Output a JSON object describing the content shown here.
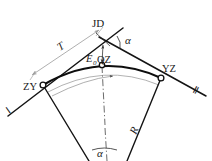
{
  "figure": {
    "colors": {
      "line_main": "#141414",
      "line_dim": "#9a9a9a",
      "line_arc_aux": "#8c8c8c",
      "background": "#ffffff",
      "text": "#1a1a1a"
    },
    "labels": {
      "jd": "JD",
      "alpha_top": "α",
      "alpha_bottom": "α",
      "tangent_len": "T",
      "external": "E",
      "external_sub": "0",
      "curve_mid": "QZ",
      "curve_start": "ZY",
      "curve_end": "YZ",
      "radius": "R",
      "tangent_line_1": "Ⅰ",
      "tangent_line_2": "Ⅱ"
    },
    "points": {
      "jd": {
        "x": 104.0,
        "y": 41.5,
        "name": "JD"
      },
      "zy": {
        "x": 43.0,
        "y": 85.0,
        "name": "ZY"
      },
      "yz": {
        "x": 161.0,
        "y": 78.0,
        "name": "YZ"
      },
      "qz": {
        "x": 102.0,
        "y": 65.0,
        "name": "QZ"
      },
      "o": {
        "x": 108.0,
        "y": 232.0,
        "name": "O"
      }
    },
    "geometry": {
      "tangent_1_start": {
        "x": 10.0,
        "y": 113.0
      },
      "tangent_1_end": {
        "x": 104.0,
        "y": 41.5
      },
      "tangent_2_start": {
        "x": 104.0,
        "y": 41.5
      },
      "tangent_2_end": {
        "x": 204.0,
        "y": 94.0
      },
      "curve_path": "M43,85 Q102,54 161,78",
      "aux_arc_path": "M50,93 Q104,64 158,86",
      "dim_T_start": {
        "x": 33.0,
        "y": 74.0
      },
      "dim_T_end": {
        "x": 97.0,
        "y": 32.0
      },
      "dim_E_top": {
        "x": 103.5,
        "y": 44.0
      },
      "dim_E_bottom": {
        "x": 102.5,
        "y": 64.0
      },
      "radius_left_start": {
        "x": 43.0,
        "y": 85.0
      },
      "radius_left_end": {
        "x": 88.0,
        "y": 161.0
      },
      "radius_right_start": {
        "x": 161.0,
        "y": 78.0
      },
      "radius_right_end": {
        "x": 128.0,
        "y": 161.0
      },
      "center_line_start": {
        "x": 102.0,
        "y": 66.0
      },
      "center_line_end": {
        "x": 106.0,
        "y": 161.0
      }
    }
  }
}
